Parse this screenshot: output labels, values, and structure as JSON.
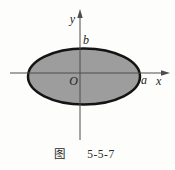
{
  "figure": {
    "type": "ellipse-diagram",
    "labels": {
      "y_axis": "y",
      "x_axis": "x",
      "origin": "O",
      "semi_major_a": "a",
      "semi_minor_b": "b"
    },
    "caption": {
      "prefix": "图",
      "number": "5-5-7"
    },
    "colors": {
      "background": "#fdfdfc",
      "ellipse_fill": "#9d9d9d",
      "ellipse_stroke": "#141414",
      "axis": "#4d4d4d",
      "text": "#1e1e1e",
      "caption_text": "#2a2a2a"
    }
  }
}
